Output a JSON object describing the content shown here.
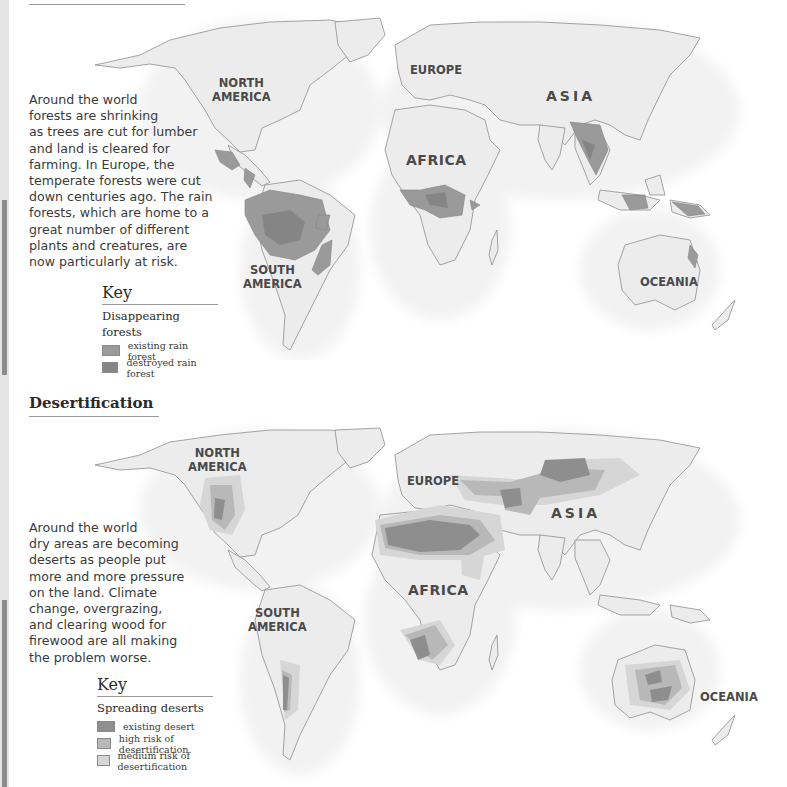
{
  "colors": {
    "land": "#ececec",
    "coast": "#8e8e8e",
    "existing_rain_forest": "#9a9a9a",
    "destroyed_rain_forest": "#858585",
    "existing_desert": "#8e8e8e",
    "high_risk": "#b8b8b8",
    "medium_risk": "#d6d6d6",
    "page": "#ffffff"
  },
  "forests": {
    "blurb_lines": [
      "Around the world",
      "forests are shrinking",
      "as trees are cut for lumber",
      "and land is cleared for",
      "farming. In Europe, the",
      "temperate forests were cut",
      "down centuries ago. The rain",
      "forests, which are home to a",
      "great number of different",
      "plants and creatures, are",
      "now particularly at risk."
    ],
    "continents": {
      "north_america_1": "NORTH",
      "north_america_2": "AMERICA",
      "europe": "EUROPE",
      "asia": "ASIA",
      "africa": "AFRICA",
      "south_america_1": "SOUTH",
      "south_america_2": "AMERICA",
      "oceania": "OCEANIA"
    },
    "key": {
      "title": "Key",
      "subtitle": "Disappearing forests",
      "items": [
        {
          "label": "existing rain forest",
          "color": "#9a9a9a"
        },
        {
          "label": "destroyed rain forest",
          "color": "#858585"
        }
      ]
    }
  },
  "desertification": {
    "title": "Desertification",
    "blurb_lines": [
      "Around the world",
      "dry areas are becoming",
      "deserts as people put",
      "more and more pressure",
      "on the land. Climate",
      "change, overgrazing,",
      "and clearing wood for",
      "firewood are all making",
      "the problem worse."
    ],
    "continents": {
      "north_america_1": "NORTH",
      "north_america_2": "AMERICA",
      "europe": "EUROPE",
      "asia": "ASIA",
      "africa": "AFRICA",
      "south_america_1": "SOUTH",
      "south_america_2": "AMERICA",
      "oceania": "OCEANIA"
    },
    "key": {
      "title": "Key",
      "subtitle": "Spreading deserts",
      "items": [
        {
          "label": "existing desert",
          "color": "#8e8e8e"
        },
        {
          "label": "high risk of desertification",
          "color": "#b8b8b8"
        },
        {
          "label": "medium risk of desertification",
          "color": "#d6d6d6"
        }
      ]
    }
  }
}
